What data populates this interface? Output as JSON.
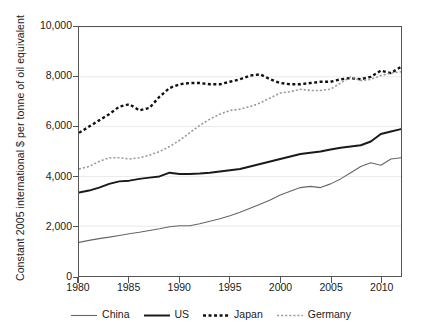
{
  "axes": {
    "ylabel": "Constant 2005 international $ per tonne of oil equivalent",
    "yticks": [
      "0",
      "2,000",
      "4,000",
      "6,000",
      "8,000",
      "10,000"
    ],
    "xticks": [
      "1980",
      "1985",
      "1990",
      "1995",
      "2000",
      "2005",
      "2010"
    ]
  },
  "legend": {
    "items": [
      {
        "label": "China",
        "color": "#666666",
        "style": "solid",
        "width": 1.1
      },
      {
        "label": "US",
        "color": "#1a1a1a",
        "style": "solid",
        "width": 2.0
      },
      {
        "label": "Japan",
        "color": "#111111",
        "style": "dashed",
        "width": 2.4
      },
      {
        "label": "Germany",
        "color": "#9a9a9a",
        "style": "dotted",
        "width": 1.6
      }
    ]
  },
  "chart_data": {
    "type": "line",
    "title": "",
    "xlabel": "",
    "ylabel": "Constant 2005 international $ per tonne of oil equivalent",
    "xlim": [
      1980,
      2012
    ],
    "ylim": [
      0,
      10000
    ],
    "grid": true,
    "legend_position": "bottom",
    "x": [
      1980,
      1981,
      1982,
      1983,
      1984,
      1985,
      1986,
      1987,
      1988,
      1989,
      1990,
      1991,
      1992,
      1993,
      1994,
      1995,
      1996,
      1997,
      1998,
      1999,
      2000,
      2001,
      2002,
      2003,
      2004,
      2005,
      2006,
      2007,
      2008,
      2009,
      2010,
      2011,
      2012
    ],
    "series": [
      {
        "name": "China",
        "color": "#666666",
        "style": "solid",
        "values": [
          1350,
          1430,
          1500,
          1560,
          1630,
          1700,
          1760,
          1830,
          1900,
          1980,
          2020,
          2020,
          2100,
          2200,
          2300,
          2420,
          2560,
          2720,
          2880,
          3050,
          3250,
          3400,
          3550,
          3600,
          3550,
          3700,
          3900,
          4150,
          4400,
          4550,
          4450,
          4700,
          4750
        ]
      },
      {
        "name": "US",
        "color": "#1a1a1a",
        "style": "solid",
        "values": [
          3350,
          3430,
          3550,
          3700,
          3800,
          3830,
          3900,
          3950,
          4000,
          4150,
          4100,
          4100,
          4120,
          4150,
          4200,
          4250,
          4300,
          4400,
          4500,
          4600,
          4700,
          4800,
          4900,
          4950,
          5000,
          5080,
          5150,
          5200,
          5250,
          5400,
          5700,
          5800,
          5900
        ]
      },
      {
        "name": "Japan",
        "color": "#111111",
        "style": "dashed",
        "values": [
          5750,
          6000,
          6250,
          6500,
          6800,
          6900,
          6650,
          6750,
          7200,
          7550,
          7700,
          7750,
          7750,
          7700,
          7700,
          7800,
          7900,
          8050,
          8100,
          7900,
          7750,
          7700,
          7700,
          7750,
          7800,
          7800,
          7900,
          7950,
          7900,
          8000,
          8250,
          8150,
          8400
        ]
      },
      {
        "name": "Germany",
        "color": "#9a9a9a",
        "style": "dotted",
        "values": [
          4300,
          4400,
          4600,
          4750,
          4750,
          4700,
          4750,
          4850,
          5000,
          5200,
          5450,
          5750,
          6050,
          6300,
          6500,
          6650,
          6700,
          6800,
          6950,
          7150,
          7350,
          7400,
          7500,
          7450,
          7450,
          7500,
          7750,
          8000,
          7850,
          7900,
          8050,
          8150,
          8200
        ]
      }
    ]
  }
}
